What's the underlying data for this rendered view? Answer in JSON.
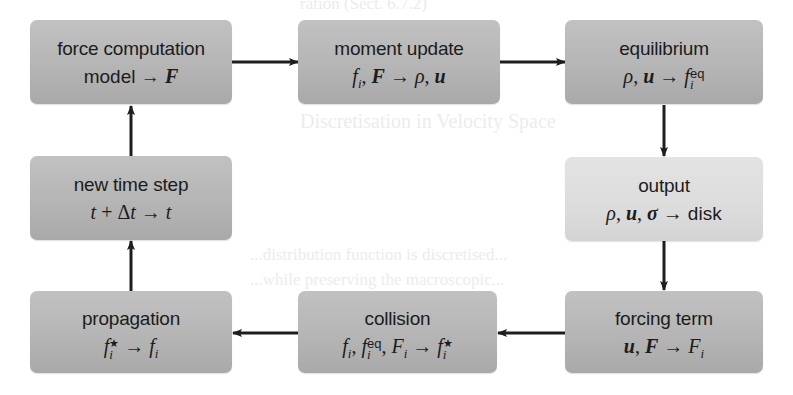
{
  "diagram": {
    "type": "flowchart-cycle",
    "background_color": "#ffffff",
    "box_color": "#b8b8b8",
    "highlight_box_color": "#dcdcdc",
    "arrow_color": "#1e1e1e"
  },
  "boxes": [
    {
      "id": "force",
      "title": "force computation",
      "formula_text": "model → F",
      "formula": {
        "pre": "model → ",
        "F": "F"
      }
    },
    {
      "id": "moment",
      "title": "moment update",
      "formula_text": "f_i, F → ρ, u",
      "formula": {
        "f": "f",
        "i": "i",
        "sep": ", ",
        "F": "F",
        "arrow": " → ",
        "rho": "ρ",
        "comma": ", ",
        "u": "u"
      }
    },
    {
      "id": "equilibrium",
      "title": "equilibrium",
      "formula_text": "ρ, u → f_i^eq",
      "formula": {
        "rho": "ρ",
        "comma": ", ",
        "u": "u",
        "arrow": " → ",
        "f": "f",
        "sup": "eq",
        "sub": "i"
      }
    },
    {
      "id": "output",
      "title": "output",
      "formula_text": "ρ, u, σ → disk",
      "formula": {
        "rho": "ρ",
        "comma1": ", ",
        "u": "u",
        "comma2": ", ",
        "sigma": "σ",
        "arrow": " → ",
        "disk": "disk"
      }
    },
    {
      "id": "forcing",
      "title": "forcing term",
      "formula_text": "u, F → F_i",
      "formula": {
        "u": "u",
        "comma": ", ",
        "F": "F",
        "arrow": " → ",
        "Fi": "F",
        "sub": "i"
      }
    },
    {
      "id": "collision",
      "title": "collision",
      "formula_text": "f_i, f_i^eq, F_i → f_i^*",
      "formula": {
        "f1": "f",
        "i1": "i",
        "c1": ", ",
        "f2": "f",
        "sup2": "eq",
        "sub2": "i",
        "c2": ", ",
        "F": "F",
        "i3": "i",
        "arrow": " → ",
        "f4": "f",
        "sup4": "★",
        "sub4": "i"
      }
    },
    {
      "id": "propagation",
      "title": "propagation",
      "formula_text": "f_i^* → f_i",
      "formula": {
        "f1": "f",
        "sup1": "★",
        "sub1": "i",
        "arrow": " → ",
        "f2": "f",
        "i2": "i"
      }
    },
    {
      "id": "timestep",
      "title": "new time step",
      "formula_text": "t + Δt → t",
      "formula": {
        "t1": "t",
        "plus": " + Δ",
        "t2": "t",
        "arrow": " → ",
        "t3": "t"
      }
    }
  ],
  "edges": [
    {
      "from": "force",
      "to": "moment"
    },
    {
      "from": "moment",
      "to": "equilibrium"
    },
    {
      "from": "equilibrium",
      "to": "output"
    },
    {
      "from": "output",
      "to": "forcing"
    },
    {
      "from": "forcing",
      "to": "collision"
    },
    {
      "from": "collision",
      "to": "propagation"
    },
    {
      "from": "propagation",
      "to": "timestep"
    },
    {
      "from": "timestep",
      "to": "force"
    }
  ],
  "ghost_text": {
    "line1": "ration (Sect. 6.7.2)",
    "line2": "Discretisation in Velocity Space",
    "line3": "...distribution function is discretised...",
    "line4": "...while preserving the macroscopic..."
  }
}
